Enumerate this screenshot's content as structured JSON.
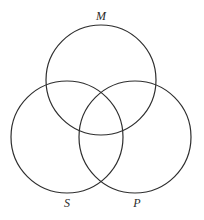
{
  "diagram": {
    "type": "venn",
    "stroke_color": "#2e2e2e",
    "background": "#ffffff",
    "circles": [
      {
        "id": "M",
        "label": "M",
        "cx": 101,
        "cy": 80,
        "r": 55,
        "label_x": 101,
        "label_y": 16
      },
      {
        "id": "S",
        "label": "S",
        "cx": 67,
        "cy": 137,
        "r": 56,
        "label_x": 67,
        "label_y": 203
      },
      {
        "id": "P",
        "label": "P",
        "cx": 135,
        "cy": 137,
        "r": 56,
        "label_x": 137,
        "label_y": 203
      }
    ]
  }
}
